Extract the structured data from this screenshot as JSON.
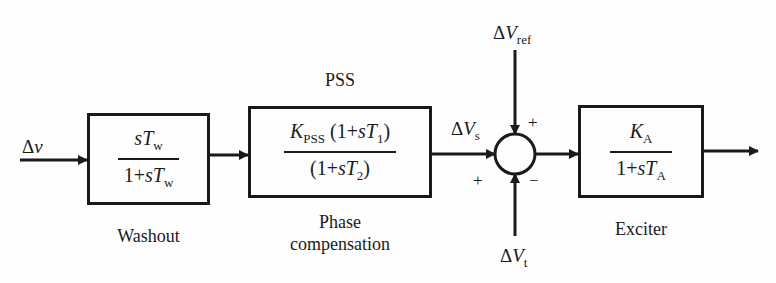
{
  "diagram": {
    "input": {
      "delta": "Δ",
      "symbol": "ν"
    },
    "washout": {
      "caption": "Washout",
      "numerator": {
        "s": "s",
        "T": "T",
        "sub": "w"
      },
      "denominator": {
        "prefix": "1+",
        "s": "s",
        "T": "T",
        "sub": "w"
      }
    },
    "pss": {
      "title": "PSS",
      "caption_line1": "Phase",
      "caption_line2": "compensation",
      "numerator": {
        "K": "K",
        "K_sub": "PSS",
        "paren_open": " (1+",
        "s": "s",
        "T": "T",
        "T_sub": "1",
        "paren_close": ")"
      },
      "denominator": {
        "paren_open": "(1+",
        "s": "s",
        "T": "T",
        "T_sub": "2",
        "paren_close": ")"
      }
    },
    "signals": {
      "vs": {
        "delta": "Δ",
        "V": "V",
        "sub": "s"
      },
      "vref": {
        "delta": "Δ",
        "V": "V",
        "sub": "ref"
      },
      "vt": {
        "delta": "Δ",
        "V": "V",
        "sub": "t"
      }
    },
    "summer": {
      "sign_vref": "+",
      "sign_vs": "+",
      "sign_vt": "−"
    },
    "exciter": {
      "caption": "Exciter",
      "numerator": {
        "K": "K",
        "sub": "A"
      },
      "denominator": {
        "prefix": "1+",
        "s": "s",
        "T": "T",
        "sub": "A"
      }
    }
  }
}
